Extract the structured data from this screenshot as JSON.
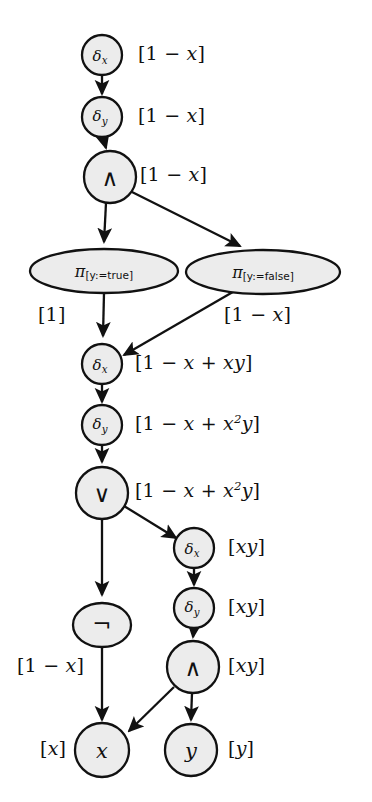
{
  "diagram": {
    "background_color": "#ffffff",
    "node_fill": "#ececec",
    "node_stroke": "#111111",
    "nodes": [
      {
        "id": "n1",
        "label": "delta_x",
        "text": "δ",
        "sub": "x",
        "shape": "circle",
        "cx": 102,
        "cy": 55,
        "r": 20
      },
      {
        "id": "n2",
        "label": "delta_y",
        "text": "δ",
        "sub": "y",
        "shape": "circle",
        "cx": 102,
        "cy": 117,
        "r": 20
      },
      {
        "id": "n3",
        "label": "and-1",
        "text": "∧",
        "sub": "",
        "shape": "circle",
        "cx": 110,
        "cy": 177,
        "r": 26
      },
      {
        "id": "n4",
        "label": "pi-y-true",
        "text": "π",
        "sub": "[y:=true]",
        "shape": "ellipse",
        "cx": 104,
        "cy": 271,
        "rx": 74,
        "ry": 22
      },
      {
        "id": "n5",
        "label": "pi-y-false",
        "text": "π",
        "sub": "[y:=false]",
        "shape": "ellipse",
        "cx": 263,
        "cy": 272,
        "rx": 77,
        "ry": 22
      },
      {
        "id": "n6",
        "label": "delta_x-2",
        "text": "δ",
        "sub": "x",
        "shape": "circle",
        "cx": 102,
        "cy": 364,
        "r": 20
      },
      {
        "id": "n7",
        "label": "delta_y-2",
        "text": "δ",
        "sub": "y",
        "shape": "circle",
        "cx": 102,
        "cy": 425,
        "r": 20
      },
      {
        "id": "n8",
        "label": "or",
        "text": "∨",
        "sub": "",
        "shape": "circle",
        "cx": 102,
        "cy": 493,
        "r": 26
      },
      {
        "id": "n9",
        "label": "delta_x-3",
        "text": "δ",
        "sub": "x",
        "shape": "circle",
        "cx": 194,
        "cy": 548,
        "r": 20
      },
      {
        "id": "n10",
        "label": "delta_y-3",
        "text": "δ",
        "sub": "y",
        "shape": "circle",
        "cx": 194,
        "cy": 608,
        "r": 20
      },
      {
        "id": "n11",
        "label": "not",
        "text": "¬",
        "sub": "",
        "shape": "ellipse",
        "cx": 102,
        "cy": 625,
        "rx": 29,
        "ry": 22
      },
      {
        "id": "n12",
        "label": "and-2",
        "text": "∧",
        "sub": "",
        "shape": "circle",
        "cx": 193,
        "cy": 667,
        "r": 26
      },
      {
        "id": "n13",
        "label": "var-x",
        "text": "x",
        "sub": "",
        "shape": "circle",
        "cx": 102,
        "cy": 750,
        "r": 27
      },
      {
        "id": "n14",
        "label": "var-y",
        "text": "y",
        "sub": "",
        "shape": "circle",
        "cx": 191,
        "cy": 750,
        "r": 26
      }
    ],
    "edges": [
      {
        "from": "delta_x",
        "to": "delta_y"
      },
      {
        "from": "delta_y",
        "to": "and-1"
      },
      {
        "from": "and-1",
        "to": "pi-y-true"
      },
      {
        "from": "and-1",
        "to": "pi-y-false"
      },
      {
        "from": "pi-y-true",
        "to": "delta_x-2"
      },
      {
        "from": "pi-y-false",
        "to": "delta_x-2"
      },
      {
        "from": "delta_x-2",
        "to": "delta_y-2"
      },
      {
        "from": "delta_y-2",
        "to": "or"
      },
      {
        "from": "or",
        "to": "delta_x-3"
      },
      {
        "from": "or",
        "to": "not"
      },
      {
        "from": "delta_x-3",
        "to": "delta_y-3"
      },
      {
        "from": "delta_y-3",
        "to": "and-2"
      },
      {
        "from": "not",
        "to": "var-x"
      },
      {
        "from": "and-2",
        "to": "var-x"
      },
      {
        "from": "and-2",
        "to": "var-y"
      }
    ],
    "annotations": [
      {
        "id": "a1",
        "for": "delta_x",
        "text": "[1 − x]",
        "html": "[1 &minus; <i>x</i>]",
        "x": 138,
        "y": 44
      },
      {
        "id": "a2",
        "for": "delta_y",
        "text": "[1 − x]",
        "html": "[1 &minus; <i>x</i>]",
        "x": 138,
        "y": 106
      },
      {
        "id": "a3",
        "for": "and-1",
        "text": "[1 − x]",
        "html": "[1 &minus; <i>x</i>]",
        "x": 140,
        "y": 165
      },
      {
        "id": "a4",
        "for": "pi-y-true",
        "text": "[1]",
        "html": "[1]",
        "x": 38,
        "y": 305
      },
      {
        "id": "a5",
        "for": "pi-y-false",
        "text": "[1 − x]",
        "html": "[1 &minus; <i>x</i>]",
        "x": 224,
        "y": 305
      },
      {
        "id": "a6",
        "for": "delta_x-2",
        "text": "[1 − x + xy]",
        "html": "[1 &minus; <i>x</i> + <i>xy</i>]",
        "x": 135,
        "y": 353
      },
      {
        "id": "a7",
        "for": "delta_y-2",
        "text": "[1 − x + x²y]",
        "html": "[1 &minus; <i>x</i> + <i>x</i><sup>2</sup><i>y</i>]",
        "x": 135,
        "y": 414
      },
      {
        "id": "a8",
        "for": "or",
        "text": "[1 − x + x²y]",
        "html": "[1 &minus; <i>x</i> + <i>x</i><sup>2</sup><i>y</i>]",
        "x": 135,
        "y": 481
      },
      {
        "id": "a9",
        "for": "delta_x-3",
        "text": "[xy]",
        "html": "[<i>xy</i>]",
        "x": 228,
        "y": 537
      },
      {
        "id": "a10",
        "for": "delta_y-3",
        "text": "[xy]",
        "html": "[<i>xy</i>]",
        "x": 228,
        "y": 597
      },
      {
        "id": "a11",
        "for": "not",
        "text": "[1 − x]",
        "html": "[1 &minus; <i>x</i>]",
        "x": 17,
        "y": 656
      },
      {
        "id": "a12",
        "for": "and-2",
        "text": "[xy]",
        "html": "[<i>xy</i>]",
        "x": 228,
        "y": 656
      },
      {
        "id": "a13",
        "for": "var-x",
        "text": "[x]",
        "html": "[<i>x</i>]",
        "x": 40,
        "y": 739
      },
      {
        "id": "a14",
        "for": "var-y",
        "text": "[y]",
        "html": "[<i>y</i>]",
        "x": 228,
        "y": 739
      }
    ]
  }
}
